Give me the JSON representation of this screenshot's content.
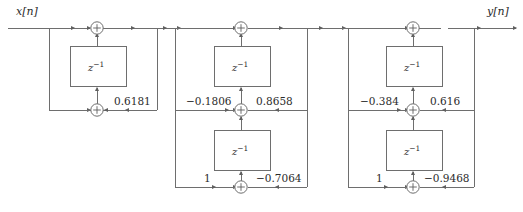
{
  "diagram": {
    "type": "signal-flow-graph",
    "input_label": "x[n]",
    "output_label": "y[n]",
    "delay_label_base": "z",
    "delay_label_exp": "−1",
    "line_color": "#6e6e6e",
    "text_color": "#2b2b2b",
    "background": "#ffffff",
    "sections": [
      {
        "name": "section-1",
        "order": 1,
        "delay_count": 1,
        "coefficients": [
          {
            "name": "k1",
            "value": "0.6181",
            "row": "lower",
            "side": "right"
          }
        ]
      },
      {
        "name": "section-2",
        "order": 2,
        "delay_count": 2,
        "coefficients": [
          {
            "name": "a2-left",
            "value": "−0.1806",
            "row": "middle",
            "side": "left"
          },
          {
            "name": "a2-right",
            "value": "0.8658",
            "row": "middle",
            "side": "right"
          },
          {
            "name": "b2-left",
            "value": "1",
            "row": "lower",
            "side": "left"
          },
          {
            "name": "b2-right",
            "value": "−0.7064",
            "row": "lower",
            "side": "right"
          }
        ]
      },
      {
        "name": "section-3",
        "order": 3,
        "delay_count": 2,
        "coefficients": [
          {
            "name": "a3-left",
            "value": "−0.384",
            "row": "middle",
            "side": "left"
          },
          {
            "name": "a3-right",
            "value": "0.616",
            "row": "middle",
            "side": "right"
          },
          {
            "name": "b3-left",
            "value": "1",
            "row": "lower",
            "side": "left"
          },
          {
            "name": "b3-right",
            "value": "−0.9468",
            "row": "lower",
            "side": "right"
          }
        ]
      }
    ],
    "adders": [
      {
        "name": "adder-s1-top",
        "symbol": "+"
      },
      {
        "name": "adder-s1-bottom",
        "symbol": "+"
      },
      {
        "name": "adder-s2-top",
        "symbol": "+"
      },
      {
        "name": "adder-s2-middle",
        "symbol": "+"
      },
      {
        "name": "adder-s2-bottom",
        "symbol": "+"
      },
      {
        "name": "adder-s3-top",
        "symbol": "+"
      },
      {
        "name": "adder-s3-middle",
        "symbol": "+"
      },
      {
        "name": "adder-s3-bottom",
        "symbol": "+"
      }
    ]
  }
}
